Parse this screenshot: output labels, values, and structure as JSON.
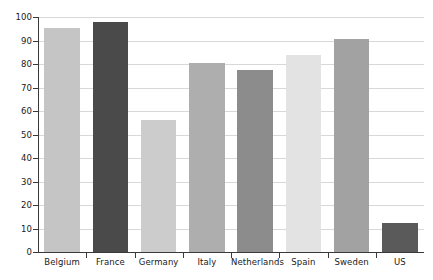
{
  "chart_data": {
    "type": "bar",
    "title": "",
    "subtitle": "",
    "xlabel": "",
    "ylabel": "",
    "categories": [
      "Belgium",
      "France",
      "Germany",
      "Italy",
      "Netherlands",
      "Spain",
      "Sweden",
      "US"
    ],
    "values": [
      95.5,
      98,
      56,
      80.5,
      77.5,
      84,
      90.5,
      12.5
    ],
    "series": [
      {
        "name": "",
        "values": [
          95.5,
          98,
          56,
          80.5,
          77.5,
          84,
          90.5,
          12.5
        ]
      }
    ],
    "bar_colors": [
      "#c5c5c5",
      "#4a4a4a",
      "#cccccc",
      "#aeaeae",
      "#8c8c8c",
      "#e3e3e3",
      "#a2a2a2",
      "#5a5a5a"
    ],
    "ylim": [
      0,
      100
    ],
    "ytick_step": 10,
    "ytick_labels": [
      "0",
      "10",
      "20",
      "30",
      "40",
      "50",
      "60",
      "70",
      "80",
      "90",
      "100"
    ],
    "grid": true,
    "grid_axis": "y",
    "legend": false,
    "legend_position": "none",
    "axis_color": "#3a3a3a",
    "gridline_color": "#d8d8d8",
    "background_color": "#ffffff"
  }
}
